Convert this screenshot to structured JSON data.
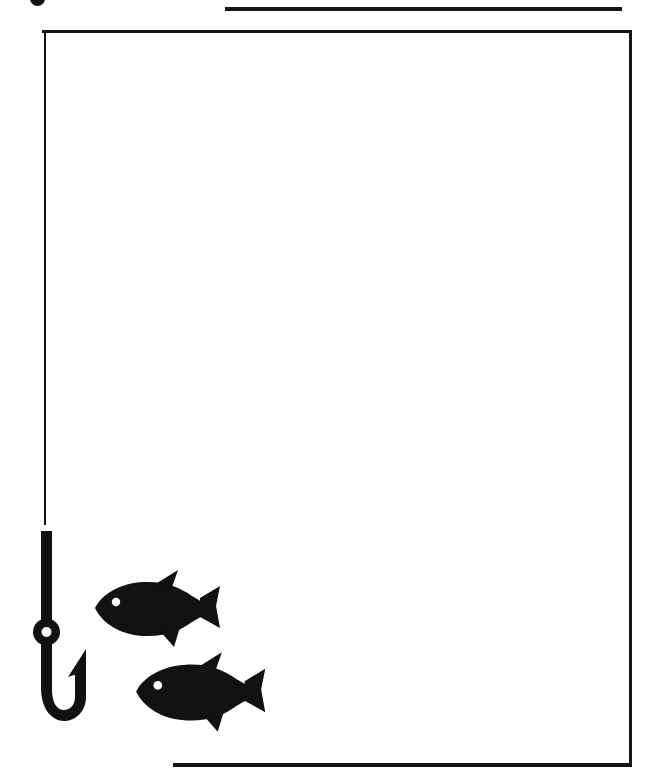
{
  "page": {
    "background_color": "#ffffff",
    "ink_color": "#141414",
    "width": 659,
    "height": 784
  },
  "marks": {
    "top_blob": {
      "name": "top-edge-ink-blob",
      "description": "small dark round mark clipped by the top page edge"
    },
    "rule_top": {
      "name": "top-horizontal-rule",
      "description": "thick horizontal line near the top of the page"
    },
    "rule_bottom": {
      "name": "bottom-horizontal-rule",
      "description": "thick horizontal line near the bottom of the page"
    }
  },
  "frame": {
    "name": "content-frame",
    "description": "thin open rectangle border around the blank content area",
    "sides_drawn": [
      "top",
      "right",
      "left-partial"
    ]
  },
  "illustration": {
    "name": "fishing-illustration",
    "items": [
      {
        "name": "fish-hook",
        "label": "Fishing hook",
        "color": "#111111",
        "parts": [
          "line",
          "shank",
          "eye-ring",
          "bend",
          "point",
          "barb"
        ]
      },
      {
        "name": "fish-upper",
        "label": "Fish",
        "color": "#111111",
        "facing": "left",
        "eye_color": "#ffffff"
      },
      {
        "name": "fish-lower",
        "label": "Fish",
        "color": "#111111",
        "facing": "left",
        "eye_color": "#ffffff"
      }
    ]
  }
}
